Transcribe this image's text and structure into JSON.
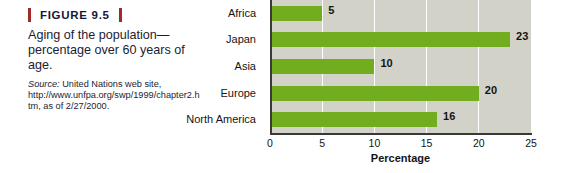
{
  "figure": {
    "number_label": "FIGURE 9.5",
    "title": "Aging of the population—percentage over 60 years of age.",
    "source_word": "Source:",
    "source_text": " United Nations web site, http://www.unfpa.org/swp/1999/chapter2.htm, as of 2/27/2000.",
    "rule_color": "#9e2b2b"
  },
  "chart_data": {
    "type": "bar",
    "orientation": "horizontal",
    "title": "",
    "categories": [
      "Africa",
      "Japan",
      "Asia",
      "Europe",
      "North America"
    ],
    "values": [
      5,
      23,
      10,
      20,
      16
    ],
    "value_labels": [
      "5",
      "23",
      "10",
      "20",
      "16"
    ],
    "xlabel": "Percentage",
    "ylabel": "",
    "xlim": [
      0,
      25
    ],
    "xticks": [
      0,
      5,
      10,
      15,
      20,
      25
    ],
    "xtick_labels": [
      "0",
      "5",
      "10",
      "15",
      "20",
      "25"
    ],
    "grid": true,
    "grid_color": "#ffffff",
    "legend": false,
    "bar_color": "#71ad1e",
    "plot_background": "#d2d2c8",
    "axis_color": "#3a3a34"
  }
}
